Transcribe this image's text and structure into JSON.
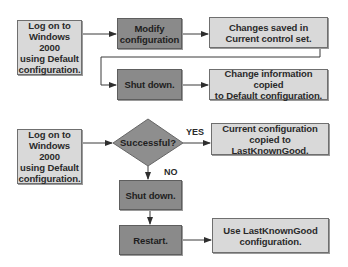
{
  "diagram": {
    "type": "flowchart",
    "colors": {
      "light_box": "#d9d9d9",
      "mid_box": "#a7a7a7",
      "dark_box": "#8a8a8a",
      "diamond": "#8e8e8e",
      "line": "#3a3a3a"
    },
    "top_flow": {
      "start": "Log on to\nWindows 2000\nusing Default\nconfiguration.",
      "modify": "Modify\nconfiguration",
      "changes_saved": "Changes saved in\nCurrent control set.",
      "shut_down": "Shut down.",
      "change_copied": "Change information copied\nto Default configuration."
    },
    "bottom_flow": {
      "start": "Log on to\nWindows 2000\nusing Default\nconfiguration.",
      "decision": "Successful?",
      "yes_label": "YES",
      "no_label": "NO",
      "yes_result": "Current configuration\ncopied to LastKnownGood.",
      "shut_down": "Shut down.",
      "restart": "Restart.",
      "restart_result": "Use LastKnownGood\nconfiguration."
    }
  }
}
